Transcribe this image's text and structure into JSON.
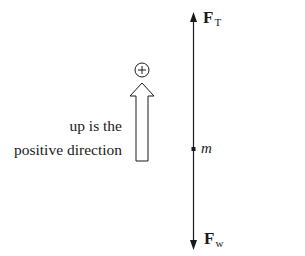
{
  "diagram": {
    "type": "free-body diagram",
    "forces": {
      "tension": {
        "symbol": "F",
        "subscript": "T",
        "direction": "up"
      },
      "weight": {
        "symbol": "F",
        "subscript": "w",
        "direction": "down"
      }
    },
    "mass": {
      "label": "m"
    },
    "sign_convention": {
      "symbol": "+",
      "caption_line1": "up is the",
      "caption_line2": "positive direction"
    },
    "colors": {
      "stroke": "#1a1a1a",
      "background": "#ffffff"
    }
  }
}
